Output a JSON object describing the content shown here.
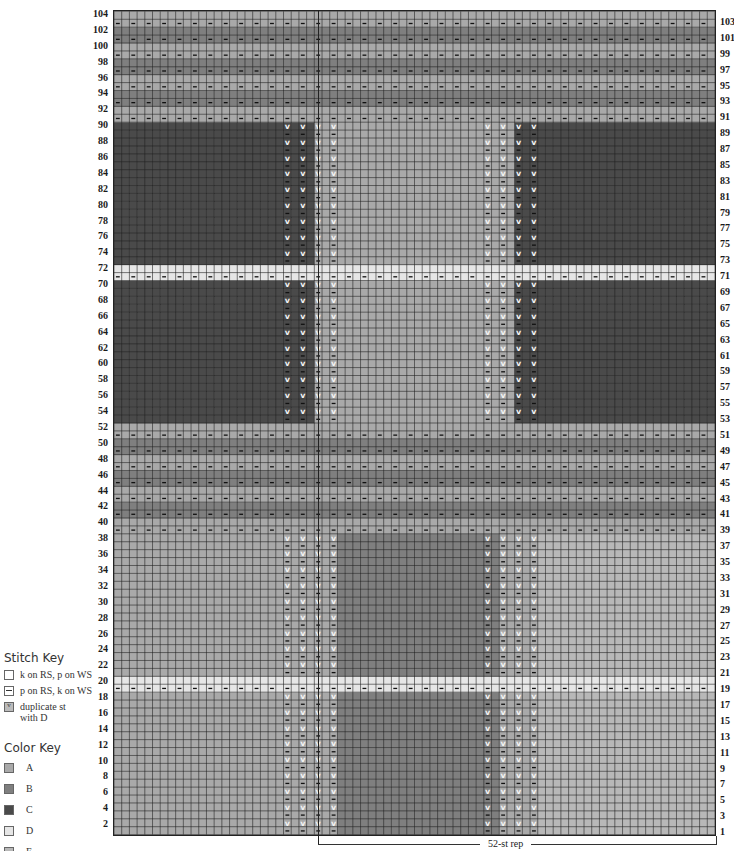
{
  "chart": {
    "rows": 104,
    "cols": 78,
    "colors": {
      "A": "#a9a9a9",
      "B": "#7f7f7f",
      "C": "#4a4a4a",
      "D": "#e6e6e6",
      "E": "#b8b8b8"
    },
    "rep_label": "52-st rep",
    "rep_start_col": 26,
    "left_row_labels": [
      2,
      4,
      6,
      8,
      10,
      12,
      14,
      16,
      18,
      20,
      22,
      24,
      26,
      28,
      30,
      32,
      34,
      36,
      38,
      40,
      42,
      44,
      46,
      48,
      50,
      52,
      54,
      56,
      58,
      60,
      62,
      64,
      66,
      68,
      70,
      72,
      74,
      76,
      78,
      80,
      82,
      84,
      86,
      88,
      90,
      92,
      94,
      96,
      98,
      100,
      102,
      104
    ],
    "right_row_labels": [
      1,
      3,
      5,
      7,
      9,
      11,
      13,
      15,
      17,
      19,
      21,
      23,
      25,
      27,
      29,
      31,
      33,
      35,
      37,
      39,
      41,
      43,
      45,
      47,
      49,
      51,
      53,
      55,
      57,
      59,
      61,
      63,
      65,
      67,
      69,
      71,
      73,
      75,
      77,
      79,
      81,
      83,
      85,
      87,
      89,
      91,
      93,
      95,
      97,
      99,
      101,
      103
    ],
    "purl_rows": "odd",
    "sections": [
      {
        "name": "lower-block-1",
        "rows": [
          1,
          18
        ],
        "zones": [
          {
            "from": 0,
            "to": 28,
            "color": "A"
          },
          {
            "from": 29,
            "to": 49,
            "color": "B"
          },
          {
            "from": 50,
            "to": 54,
            "color": "A"
          },
          {
            "from": 55,
            "to": 77,
            "color": "E"
          }
        ],
        "dup_cols": [
          22,
          24,
          26,
          28,
          48,
          50,
          52,
          54
        ],
        "purl_cols": "dup"
      },
      {
        "name": "stripe-D-low",
        "rows": [
          19,
          20
        ],
        "zones": [
          {
            "from": 0,
            "to": 77,
            "color": "D"
          }
        ],
        "dup_cols": [],
        "purl_cols": "all"
      },
      {
        "name": "lower-block-2",
        "rows": [
          21,
          38
        ],
        "zones": [
          {
            "from": 0,
            "to": 28,
            "color": "A"
          },
          {
            "from": 29,
            "to": 49,
            "color": "B"
          },
          {
            "from": 50,
            "to": 54,
            "color": "A"
          },
          {
            "from": 55,
            "to": 77,
            "color": "E"
          }
        ],
        "dup_cols": [
          22,
          24,
          26,
          28,
          48,
          50,
          52,
          54
        ],
        "purl_cols": "dup"
      },
      {
        "name": "stripes-mid",
        "rows": [
          39,
          52
        ],
        "zones": [],
        "stripe_pattern": [
          "A",
          "A",
          "B",
          "B"
        ],
        "dup_cols": [],
        "purl_cols": "all"
      },
      {
        "name": "upper-block-1",
        "rows": [
          53,
          70
        ],
        "zones": [
          {
            "from": 0,
            "to": 25,
            "color": "C"
          },
          {
            "from": 26,
            "to": 51,
            "color": "A"
          },
          {
            "from": 52,
            "to": 77,
            "color": "C"
          }
        ],
        "dup_cols": [
          22,
          24,
          26,
          28,
          48,
          50,
          52,
          54
        ],
        "purl_cols": "dup"
      },
      {
        "name": "stripe-D-high",
        "rows": [
          71,
          72
        ],
        "zones": [
          {
            "from": 0,
            "to": 77,
            "color": "D"
          }
        ],
        "dup_cols": [],
        "purl_cols": "all"
      },
      {
        "name": "upper-block-2",
        "rows": [
          73,
          90
        ],
        "zones": [
          {
            "from": 0,
            "to": 25,
            "color": "C"
          },
          {
            "from": 26,
            "to": 51,
            "color": "A"
          },
          {
            "from": 52,
            "to": 77,
            "color": "C"
          }
        ],
        "dup_cols": [
          22,
          24,
          26,
          28,
          48,
          50,
          52,
          54
        ],
        "purl_cols": "dup"
      },
      {
        "name": "stripes-top",
        "rows": [
          91,
          104
        ],
        "zones": [],
        "stripe_pattern": [
          "A",
          "A",
          "B",
          "B"
        ],
        "dup_cols": [],
        "purl_cols": "all"
      }
    ]
  },
  "stitch_key": {
    "title": "Stitch Key",
    "items": [
      {
        "symbol": "blank",
        "label": "k on RS, p on WS"
      },
      {
        "symbol": "dash",
        "label": "p on RS, k on WS"
      },
      {
        "symbol": "v",
        "label": "duplicate st",
        "label2": "with D"
      }
    ]
  },
  "color_key": {
    "title": "Color Key",
    "items": [
      {
        "code": "A",
        "color": "#a9a9a9"
      },
      {
        "code": "B",
        "color": "#7f7f7f"
      },
      {
        "code": "C",
        "color": "#4a4a4a"
      },
      {
        "code": "D",
        "color": "#e6e6e6"
      },
      {
        "code": "E",
        "color": "#b8b8b8"
      }
    ]
  }
}
